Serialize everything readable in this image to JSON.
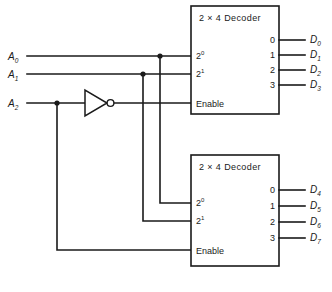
{
  "diagram": {
    "inputs": [
      {
        "name": "A0",
        "label": "A",
        "sub": "0"
      },
      {
        "name": "A1",
        "label": "A",
        "sub": "1"
      },
      {
        "name": "A2",
        "label": "A",
        "sub": "2"
      }
    ],
    "inverter": {
      "name": "not-gate",
      "label": ""
    },
    "decoders": [
      {
        "name": "top-decoder",
        "title": "2  ×  4 Decoder",
        "input_pins": [
          {
            "label": "2",
            "sup": "0"
          },
          {
            "label": "2",
            "sup": "1"
          }
        ],
        "enable_label": "Enable",
        "output_numbers": [
          "0",
          "1",
          "2",
          "3"
        ],
        "outputs": [
          {
            "label": "D",
            "sub": "0"
          },
          {
            "label": "D",
            "sub": "1"
          },
          {
            "label": "D",
            "sub": "2"
          },
          {
            "label": "D",
            "sub": "3"
          }
        ]
      },
      {
        "name": "bottom-decoder",
        "title": "2  ×  4 Decoder",
        "input_pins": [
          {
            "label": "2",
            "sup": "0"
          },
          {
            "label": "2",
            "sup": "1"
          }
        ],
        "enable_label": "Enable",
        "output_numbers": [
          "0",
          "1",
          "2",
          "3"
        ],
        "outputs": [
          {
            "label": "D",
            "sub": "4"
          },
          {
            "label": "D",
            "sub": "5"
          },
          {
            "label": "D",
            "sub": "6"
          },
          {
            "label": "D",
            "sub": "7"
          }
        ]
      }
    ],
    "colors": {
      "line": "#1a1a1a",
      "background": "#ffffff"
    }
  }
}
